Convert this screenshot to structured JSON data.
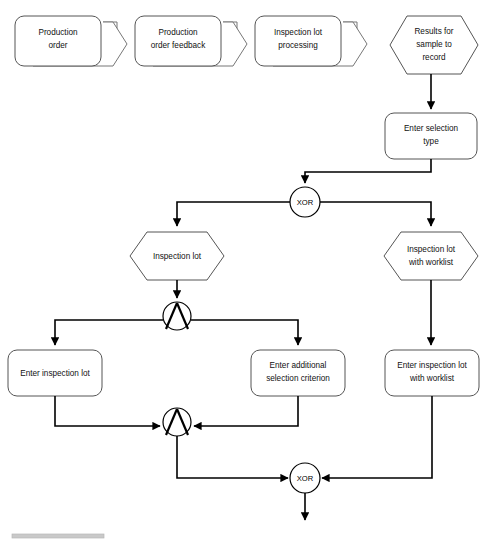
{
  "diagram": {
    "type": "epc-flowchart",
    "canvas": {
      "width": 486,
      "height": 542
    },
    "colors": {
      "background": "#ffffff",
      "shape_stroke": "#555555",
      "shape_stroke_back": "#777777",
      "edge_stroke": "#000000",
      "text": "#111111",
      "footer_rule": "#c9c9c9"
    },
    "process_paths": [
      {
        "id": "pp-production-order",
        "label_lines": [
          "Production",
          "order"
        ],
        "x": 15,
        "y": 16,
        "w": 86,
        "h": 50
      },
      {
        "id": "pp-production-order-feedback",
        "label_lines": [
          "Production",
          "order feedback"
        ],
        "x": 135,
        "y": 16,
        "w": 86,
        "h": 50
      },
      {
        "id": "pp-inspection-lot-processing",
        "label_lines": [
          "Inspection lot",
          "processing"
        ],
        "x": 255,
        "y": 16,
        "w": 86,
        "h": 50
      },
      {
        "id": "pp-results-for-sample",
        "label_lines": [
          "Results for",
          "sample to",
          "record"
        ],
        "x": 390,
        "y": 16,
        "w": 88,
        "h": 58
      }
    ],
    "events": [
      {
        "id": "ev-inspection-lot",
        "label_lines": [
          "Inspection lot"
        ],
        "x": 130,
        "y": 232,
        "w": 94,
        "h": 48
      },
      {
        "id": "ev-inspection-lot-worklist",
        "label_lines": [
          "Inspection lot",
          "with worklist"
        ],
        "x": 384,
        "y": 232,
        "w": 94,
        "h": 48
      },
      {
        "id": "ev-results-for-sample",
        "label_lines": [
          "Results for",
          "sample to",
          "record"
        ],
        "x": 390,
        "y": 16,
        "w": 88,
        "h": 58
      }
    ],
    "functions": [
      {
        "id": "fn-enter-selection-type",
        "label_lines": [
          "Enter selection",
          "type"
        ],
        "x": 385,
        "y": 113,
        "w": 92,
        "h": 46
      },
      {
        "id": "fn-enter-inspection-lot",
        "label_lines": [
          "Enter inspection lot"
        ],
        "x": 8,
        "y": 350,
        "w": 94,
        "h": 46
      },
      {
        "id": "fn-enter-additional-selection-criterion",
        "label_lines": [
          "Enter additional",
          "selection criterion"
        ],
        "x": 251,
        "y": 350,
        "w": 94,
        "h": 46
      },
      {
        "id": "fn-enter-inspection-lot-with-worklist",
        "label_lines": [
          "Enter inspection lot",
          "with worklist"
        ],
        "x": 385,
        "y": 350,
        "w": 94,
        "h": 46
      }
    ],
    "connectors": [
      {
        "id": "conn-xor-split-selection",
        "kind": "XOR",
        "label": "XOR",
        "cx": 305,
        "cy": 202,
        "r": 15
      },
      {
        "id": "conn-and-split-inspection-lot",
        "kind": "AND",
        "label": "",
        "cx": 177,
        "cy": 316,
        "r": 14
      },
      {
        "id": "conn-and-join-inspection-lot",
        "kind": "AND",
        "label": "",
        "cx": 177,
        "cy": 422,
        "r": 14
      },
      {
        "id": "conn-xor-join-final",
        "kind": "XOR",
        "label": "XOR",
        "cx": 305,
        "cy": 478,
        "r": 15
      }
    ],
    "edges": [
      {
        "id": "edge-results-to-enter-selection-type",
        "from": "ev-results-for-sample",
        "to": "fn-enter-selection-type"
      },
      {
        "id": "edge-enter-selection-type-to-xor",
        "from": "fn-enter-selection-type",
        "to": "conn-xor-split-selection"
      },
      {
        "id": "edge-xor-to-inspection-lot",
        "from": "conn-xor-split-selection",
        "to": "ev-inspection-lot"
      },
      {
        "id": "edge-xor-to-inspection-lot-worklist",
        "from": "conn-xor-split-selection",
        "to": "ev-inspection-lot-worklist"
      },
      {
        "id": "edge-inspection-lot-to-and-split",
        "from": "ev-inspection-lot",
        "to": "conn-and-split-inspection-lot"
      },
      {
        "id": "edge-and-split-to-enter-inspection-lot",
        "from": "conn-and-split-inspection-lot",
        "to": "fn-enter-inspection-lot"
      },
      {
        "id": "edge-and-split-to-enter-additional-criterion",
        "from": "conn-and-split-inspection-lot",
        "to": "fn-enter-additional-selection-criterion"
      },
      {
        "id": "edge-enter-inspection-lot-to-and-join",
        "from": "fn-enter-inspection-lot",
        "to": "conn-and-join-inspection-lot"
      },
      {
        "id": "edge-enter-additional-criterion-to-and-join",
        "from": "fn-enter-additional-selection-criterion",
        "to": "conn-and-join-inspection-lot"
      },
      {
        "id": "edge-and-join-to-xor-join",
        "from": "conn-and-join-inspection-lot",
        "to": "conn-xor-join-final"
      },
      {
        "id": "edge-inspection-lot-worklist-to-enter",
        "from": "ev-inspection-lot-worklist",
        "to": "fn-enter-inspection-lot-with-worklist"
      },
      {
        "id": "edge-enter-worklist-to-xor-join",
        "from": "fn-enter-inspection-lot-with-worklist",
        "to": "conn-xor-join-final"
      },
      {
        "id": "edge-xor-join-out",
        "from": "conn-xor-join-final",
        "to": "continuation"
      }
    ],
    "footer": {
      "rule_x": 12,
      "rule_y": 534,
      "rule_w": 92,
      "rule_h": 4
    }
  }
}
